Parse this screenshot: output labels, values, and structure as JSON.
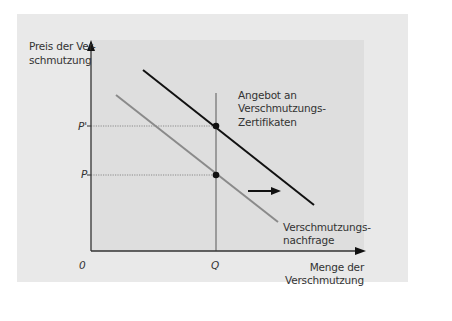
{
  "diagram": {
    "type": "economics-supply-demand-shift",
    "y_axis": {
      "label_line1": "Preis der Ver-",
      "label_line2": "schmutzung"
    },
    "x_axis": {
      "label_line1": "Menge der",
      "label_line2": "Verschmutzung"
    },
    "origin_label": "0",
    "price_ticks": {
      "p_prime": "P'",
      "p": "P"
    },
    "quantity_tick": "Q",
    "curves": {
      "supply": {
        "label_line1": "Angebot an",
        "label_line2": "Verschmutzungs-",
        "label_line3": "Zertifikaten",
        "style": "vertical line at Q (fixed certificate supply)"
      },
      "old_demand": {
        "label_line1": "Verschmutzungs-",
        "label_line2": "nachfrage",
        "color": "#8a8a8a"
      },
      "new_demand": {
        "color": "#111111"
      }
    },
    "shift_arrow": "right",
    "colors": {
      "panel_bg": "#e9e9e9",
      "plot_bg": "#dedede",
      "axis": "#333333",
      "demand_old": "#8a8a8a",
      "demand_new": "#111111",
      "supply_line": "#777777"
    }
  }
}
